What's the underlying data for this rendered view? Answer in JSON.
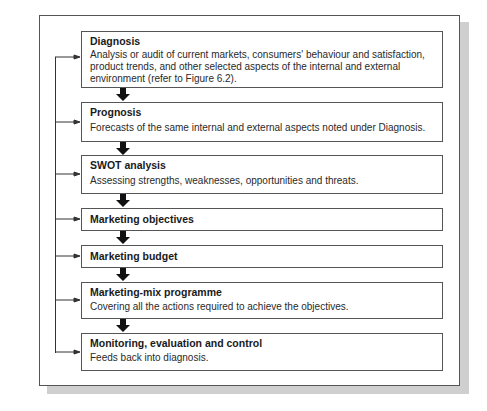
{
  "figure": {
    "steps": [
      {
        "title": "Diagnosis",
        "description": "Analysis or audit of current markets, consumers' behaviour and satisfaction, product trends, and other selected aspects of the internal and external environment (refer to Figure 6.2)."
      },
      {
        "title": "Prognosis",
        "description": "Forecasts of the same internal and external aspects noted under Diagnosis."
      },
      {
        "title": "SWOT analysis",
        "description": "Assessing strengths, weaknesses, opportunities and threats."
      },
      {
        "title": "Marketing objectives",
        "description": ""
      },
      {
        "title": "Marketing budget",
        "description": ""
      },
      {
        "title": "Marketing-mix programme",
        "description": "Covering all the actions required to achieve the objectives."
      },
      {
        "title": "Monitoring, evaluation and control",
        "description": "Feeds back into diagnosis."
      }
    ],
    "colors": {
      "border": "#555555",
      "arrow": "#111111",
      "shadow": "#cfcfcf"
    }
  }
}
